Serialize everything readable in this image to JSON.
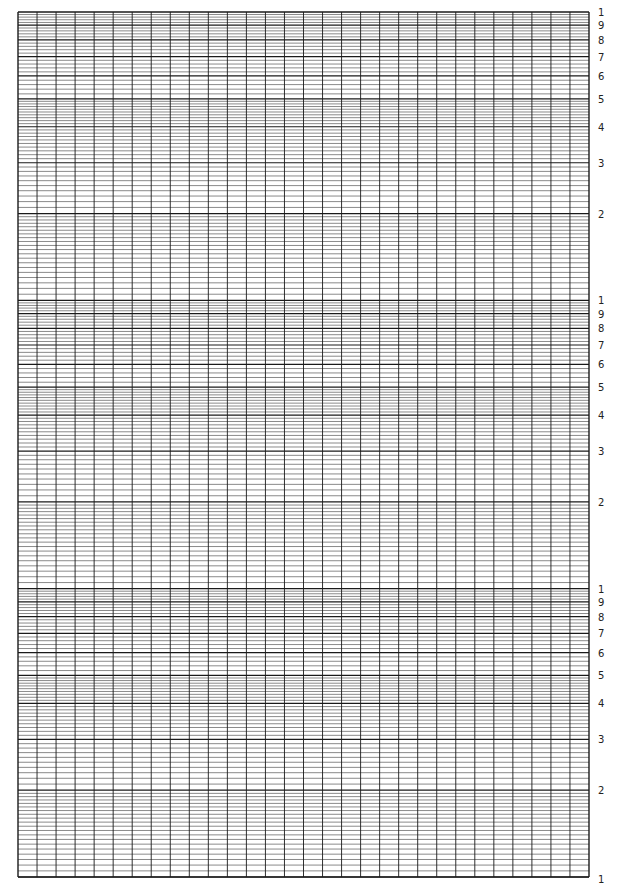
{
  "chart_data": {
    "type": "table",
    "title": "",
    "xlabel": "",
    "ylabel": "",
    "grid": true,
    "y_scale": "log",
    "cycles": 3,
    "x_divisions": 30,
    "cycle_tick_labels": [
      "1",
      "9",
      "8",
      "7",
      "6",
      "5",
      "4",
      "3",
      "2"
    ],
    "bottom_label": "1",
    "label_values": [
      10,
      9,
      8,
      7,
      6,
      5,
      4,
      3,
      2
    ],
    "minor_steps": [
      {
        "from": 1,
        "to": 2,
        "step": 0.05
      },
      {
        "from": 2,
        "to": 5,
        "step": 0.1
      },
      {
        "from": 5,
        "to": 10,
        "step": 0.2
      }
    ]
  },
  "layout": {
    "grid_left": 18,
    "grid_right": 589,
    "grid_top": 12,
    "grid_bottom": 877,
    "label_x": 598
  },
  "colors": {
    "line": "#1a1a1a",
    "minor_line": "#3a3a3a",
    "background": "#ffffff"
  }
}
